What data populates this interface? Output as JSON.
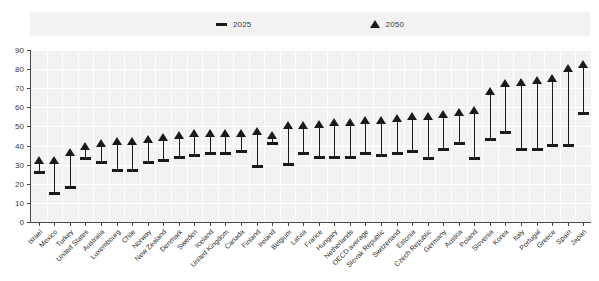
{
  "legend": {
    "position": "top-center",
    "entries": [
      {
        "label": "2025",
        "marker": "dash-marker-icon",
        "color": "#1a1a1a"
      },
      {
        "label": "2050",
        "marker": "triangle-marker-icon",
        "color": "#1a1a1a"
      }
    ]
  },
  "axes": {
    "y_ticks": [
      0,
      10,
      20,
      30,
      40,
      50,
      60,
      70,
      80,
      90
    ],
    "y_min": 0,
    "y_max": 90,
    "grid": true
  },
  "chart_data": {
    "type": "bar",
    "title": "",
    "subtitle": "",
    "xlabel": "",
    "ylabel": "",
    "ylim": [
      0,
      90
    ],
    "grid": true,
    "legend_position": "top-center",
    "categories": [
      "Israel",
      "Mexico",
      "Turkey",
      "United States",
      "Australia",
      "Luxembourg",
      "Chile",
      "Norway",
      "New Zealand",
      "Denmark",
      "Sweden",
      "Iceland",
      "United Kingdom",
      "Canada",
      "Finland",
      "Ireland",
      "Belgium",
      "Latvia",
      "France",
      "Hungary",
      "Netherlands",
      "OECD average",
      "Slovak Republic",
      "Switzerland",
      "Estonia",
      "Czech Republic",
      "Germany",
      "Austria",
      "Poland",
      "Slovenia",
      "Korea",
      "Italy",
      "Portugal",
      "Greece",
      "Spain",
      "Japan"
    ],
    "series": [
      {
        "name": "2025",
        "marker": "dash",
        "values": [
          26,
          15,
          18,
          33,
          31,
          27,
          27,
          31,
          32,
          34,
          35,
          36,
          36,
          37,
          29,
          41,
          30,
          36,
          34,
          34,
          34,
          36,
          35,
          36,
          37,
          33,
          38,
          41,
          33,
          43,
          47,
          38,
          38,
          40,
          40,
          57
        ]
      },
      {
        "name": "2050",
        "marker": "triangle",
        "values": [
          32,
          32,
          36,
          39,
          41,
          42,
          42,
          43,
          44,
          45,
          46,
          46,
          46,
          46,
          47,
          45,
          50,
          50,
          51,
          52,
          52,
          53,
          53,
          54,
          55,
          55,
          56,
          57,
          58,
          68,
          72,
          73,
          74,
          75,
          80,
          82
        ]
      }
    ]
  }
}
